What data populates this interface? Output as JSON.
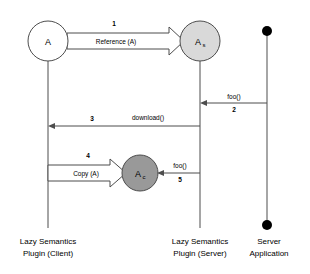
{
  "diagram": {
    "type": "uml-sequence-diagram",
    "background": "#ffffff",
    "colors": {
      "line": "#4d4d4d",
      "node_a_fill": "#ffffff",
      "node_as_fill": "#d9d9d9",
      "node_ac_fill": "#999999",
      "dot_fill": "#000000",
      "text": "#000000"
    },
    "lifelines": [
      {
        "id": "client",
        "name": "lifeline-client",
        "title_line1": "Lazy Semantics",
        "title_line2": "Plugin (Client)",
        "x": 48
      },
      {
        "id": "server",
        "name": "lifeline-server",
        "title_line1": "Lazy Semantics",
        "title_line2": "Plugin (Server)",
        "x": 200
      },
      {
        "id": "application",
        "name": "lifeline-application",
        "title_line1": "Server",
        "title_line2": "Application",
        "x": 267
      }
    ],
    "nodes": [
      {
        "id": "a",
        "name": "object-node-a",
        "label": "A",
        "subscript": "",
        "fill": "#ffffff",
        "cx": 48,
        "cy": 41,
        "r": 20
      },
      {
        "id": "as",
        "name": "object-node-a-server",
        "label": "A",
        "subscript": "s",
        "fill": "#d9d9d9",
        "cx": 200,
        "cy": 41,
        "r": 20
      },
      {
        "id": "ac",
        "name": "object-node-a-client",
        "label": "A",
        "subscript": "c",
        "fill": "#999999",
        "cx": 140,
        "cy": 173,
        "r": 18
      }
    ],
    "messages": [
      {
        "id": "m1",
        "name": "message-reference-a",
        "number": "1",
        "label": "Reference (A)",
        "style": "block-arrow",
        "direction": "right",
        "from": "a",
        "to": "as",
        "y": 41
      },
      {
        "id": "m2",
        "name": "message-foo-application-to-server",
        "number": "2",
        "label": "foo()",
        "style": "line-arrow",
        "direction": "left",
        "from": "application",
        "to": "server",
        "y": 103
      },
      {
        "id": "m3",
        "name": "message-download",
        "number": "3",
        "label": "download()",
        "style": "line-arrow",
        "direction": "left",
        "from": "server",
        "to": "client",
        "y": 126
      },
      {
        "id": "m4",
        "name": "message-copy-a",
        "number": "4",
        "label": "Copy (A)",
        "style": "block-arrow",
        "direction": "right",
        "from": "client",
        "to": "ac",
        "y": 173
      },
      {
        "id": "m5",
        "name": "message-foo-server-to-ac",
        "number": "5",
        "label": "foo()",
        "style": "line-arrow",
        "direction": "left",
        "from": "server",
        "to": "ac",
        "y": 173
      }
    ],
    "endpoint_dots": [
      {
        "name": "application-start-dot",
        "cx": 267,
        "cy": 31,
        "r": 5
      },
      {
        "name": "application-end-dot",
        "cx": 267,
        "cy": 225,
        "r": 5
      }
    ]
  }
}
